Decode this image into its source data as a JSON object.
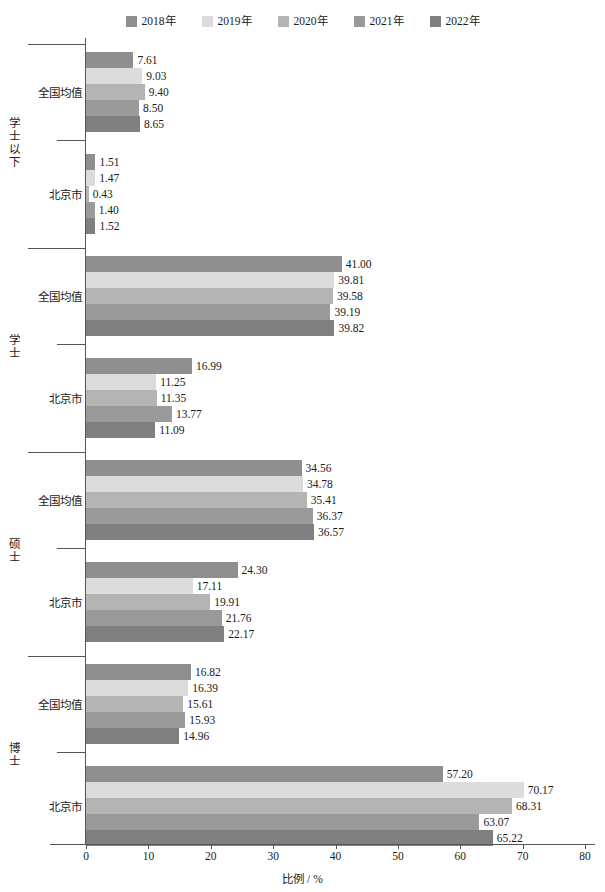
{
  "chart_data": {
    "type": "bar",
    "orientation": "horizontal",
    "title": "",
    "xlabel": "比例 / %",
    "ylabel": "",
    "xlim": [
      0,
      80
    ],
    "xticks": [
      0,
      10,
      20,
      30,
      40,
      50,
      60,
      70,
      80
    ],
    "xtick_labels": [
      "0",
      "10",
      "20",
      "30",
      "40",
      "50",
      "60",
      "70",
      "80"
    ],
    "grid": false,
    "legend_position": "top-center",
    "series": [
      {
        "name": "2018年",
        "color": "#8f8f8f"
      },
      {
        "name": "2019年",
        "color": "#dcdcdc"
      },
      {
        "name": "2020年",
        "color": "#b4b4b4"
      },
      {
        "name": "2021年",
        "color": "#9a9a9a"
      },
      {
        "name": "2022年",
        "color": "#808080"
      }
    ],
    "groups": [
      {
        "name": "学士以下",
        "subgroups": [
          {
            "name": "全国均值",
            "values": [
              7.61,
              9.03,
              9.4,
              8.5,
              8.65
            ],
            "labels": [
              "7.61",
              "9.03",
              "9.40",
              "8.50",
              "8.65"
            ]
          },
          {
            "name": "北京市",
            "values": [
              1.51,
              1.47,
              0.43,
              1.4,
              1.52
            ],
            "labels": [
              "1.51",
              "1.47",
              "0.43",
              "1.40",
              "1.52"
            ]
          }
        ]
      },
      {
        "name": "学士",
        "subgroups": [
          {
            "name": "全国均值",
            "values": [
              41.0,
              39.81,
              39.58,
              39.19,
              39.82
            ],
            "labels": [
              "41.00",
              "39.81",
              "39.58",
              "39.19",
              "39.82"
            ]
          },
          {
            "name": "北京市",
            "values": [
              16.99,
              11.25,
              11.35,
              13.77,
              11.09
            ],
            "labels": [
              "16.99",
              "11.25",
              "11.35",
              "13.77",
              "11.09"
            ]
          }
        ]
      },
      {
        "name": "硕士",
        "subgroups": [
          {
            "name": "全国均值",
            "values": [
              34.56,
              34.78,
              35.41,
              36.37,
              36.57
            ],
            "labels": [
              "34.56",
              "34.78",
              "35.41",
              "36.37",
              "36.57"
            ]
          },
          {
            "name": "北京市",
            "values": [
              24.3,
              17.11,
              19.91,
              21.76,
              22.17
            ],
            "labels": [
              "24.30",
              "17.11",
              "19.91",
              "21.76",
              "22.17"
            ]
          }
        ]
      },
      {
        "name": "博士",
        "subgroups": [
          {
            "name": "全国均值",
            "values": [
              16.82,
              16.39,
              15.61,
              15.93,
              14.96
            ],
            "labels": [
              "16.82",
              "16.39",
              "15.61",
              "15.93",
              "14.96"
            ]
          },
          {
            "name": "北京市",
            "values": [
              57.2,
              70.17,
              68.31,
              63.07,
              65.22
            ],
            "labels": [
              "57.20",
              "70.17",
              "68.31",
              "63.07",
              "65.22"
            ]
          }
        ]
      }
    ]
  },
  "legend": {
    "items": [
      {
        "label": "2018年",
        "color": "#8f8f8f"
      },
      {
        "label": "2019年",
        "color": "#dcdcdc"
      },
      {
        "label": "2020年",
        "color": "#b4b4b4"
      },
      {
        "label": "2021年",
        "color": "#9a9a9a"
      },
      {
        "label": "2022年",
        "color": "#808080"
      }
    ]
  },
  "axis": {
    "x_title": "比例 / %",
    "x_labels": [
      "0",
      "10",
      "20",
      "30",
      "40",
      "50",
      "60",
      "70",
      "80"
    ]
  }
}
